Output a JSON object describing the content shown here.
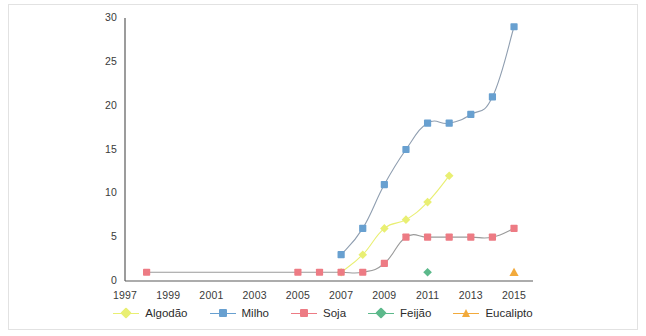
{
  "chart_data": {
    "type": "line",
    "title": "",
    "subtitle": "",
    "xlabel": "",
    "ylabel": "",
    "xlim": [
      1997,
      2015.6
    ],
    "ylim": [
      0,
      30
    ],
    "yticks": [
      0,
      5,
      10,
      15,
      20,
      25,
      30
    ],
    "xticks": [
      1997,
      1999,
      2001,
      2003,
      2005,
      2007,
      2009,
      2011,
      2013,
      2015
    ],
    "grid": false,
    "legend_position": "bottom",
    "series": [
      {
        "name": "Algodão",
        "color": "#e9ef72",
        "line_color": "#e9ef72",
        "marker": "diamond",
        "points": [
          {
            "x": 2007,
            "y": 1
          },
          {
            "x": 2008,
            "y": 3
          },
          {
            "x": 2009,
            "y": 6
          },
          {
            "x": 2010,
            "y": 7
          },
          {
            "x": 2011,
            "y": 9
          },
          {
            "x": 2012,
            "y": 12
          }
        ]
      },
      {
        "name": "Milho",
        "color": "#68a0d0",
        "line_color": "#8f9eb0",
        "marker": "square",
        "points": [
          {
            "x": 2007,
            "y": 3
          },
          {
            "x": 2008,
            "y": 6
          },
          {
            "x": 2009,
            "y": 11
          },
          {
            "x": 2010,
            "y": 15
          },
          {
            "x": 2011,
            "y": 18
          },
          {
            "x": 2012,
            "y": 18
          },
          {
            "x": 2013,
            "y": 19
          },
          {
            "x": 2014,
            "y": 21
          },
          {
            "x": 2015,
            "y": 29
          }
        ]
      },
      {
        "name": "Soja",
        "color": "#ed7b84",
        "line_color": "#9a9a9a",
        "marker": "square",
        "points": [
          {
            "x": 1998,
            "y": 1
          },
          {
            "x": 2005,
            "y": 1
          },
          {
            "x": 2006,
            "y": 1
          },
          {
            "x": 2007,
            "y": 1
          },
          {
            "x": 2008,
            "y": 1
          },
          {
            "x": 2009,
            "y": 2
          },
          {
            "x": 2010,
            "y": 5
          },
          {
            "x": 2011,
            "y": 5
          },
          {
            "x": 2012,
            "y": 5
          },
          {
            "x": 2013,
            "y": 5
          },
          {
            "x": 2014,
            "y": 5
          },
          {
            "x": 2015,
            "y": 6
          }
        ]
      },
      {
        "name": "Feijão",
        "color": "#5cb98b",
        "line_color": "#5cb98b",
        "marker": "diamond",
        "points": [
          {
            "x": 2011,
            "y": 1
          }
        ]
      },
      {
        "name": "Eucalipto",
        "color": "#f2aa3c",
        "line_color": "#f2aa3c",
        "marker": "triangle",
        "points": [
          {
            "x": 2015,
            "y": 1
          }
        ]
      }
    ]
  },
  "axes": {
    "y_tick_labels": [
      "0",
      "5",
      "10",
      "15",
      "20",
      "25",
      "30"
    ],
    "x_tick_labels": [
      "1997",
      "1999",
      "2001",
      "2003",
      "2005",
      "2007",
      "2009",
      "2011",
      "2013",
      "2015"
    ],
    "axis_color": "#5a5a5a"
  },
  "legend": {
    "entries": [
      {
        "label": "Algodão"
      },
      {
        "label": "Milho"
      },
      {
        "label": "Soja"
      },
      {
        "label": "Feijão"
      },
      {
        "label": "Eucalipto"
      }
    ]
  },
  "frame": {
    "border_color": "#e2e2e2",
    "background": "#ffffff"
  }
}
